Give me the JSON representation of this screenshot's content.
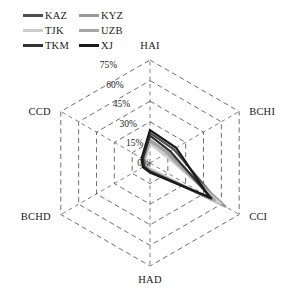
{
  "legend": {
    "items": [
      {
        "label": "KAZ",
        "color": "#4d4d4d"
      },
      {
        "label": "KYZ",
        "color": "#999999"
      },
      {
        "label": "TJK",
        "color": "#cccccc"
      },
      {
        "label": "UZB",
        "color": "#a6a6a6"
      },
      {
        "label": "TKM",
        "color": "#333333"
      },
      {
        "label": "XJ",
        "color": "#1a1a1a"
      }
    ]
  },
  "chart_data": {
    "type": "radar",
    "title": "",
    "xlabel": "",
    "ylabel": "",
    "grid": true,
    "grid_style": "dashed",
    "legend_position": "top-left",
    "categories": [
      "HAI",
      "BCHI",
      "CCI",
      "HAD",
      "BCHD",
      "CCD"
    ],
    "tick_labels": [
      "0%",
      "15%",
      "30%",
      "45%",
      "60%",
      "75%"
    ],
    "tick_values": [
      0,
      15,
      30,
      45,
      60,
      75
    ],
    "rlim": [
      0,
      75
    ],
    "tick_axis": "HAI",
    "series": [
      {
        "name": "KAZ",
        "color": "#4d4d4d",
        "values": [
          22,
          20,
          58,
          6,
          5,
          6
        ]
      },
      {
        "name": "KYZ",
        "color": "#999999",
        "values": [
          17,
          15,
          64,
          5,
          4,
          5
        ]
      },
      {
        "name": "TJK",
        "color": "#cccccc",
        "values": [
          14,
          12,
          60,
          4,
          4,
          4
        ]
      },
      {
        "name": "UZB",
        "color": "#a6a6a6",
        "values": [
          16,
          14,
          55,
          5,
          4,
          5
        ]
      },
      {
        "name": "TKM",
        "color": "#333333",
        "values": [
          20,
          17,
          52,
          6,
          5,
          6
        ]
      },
      {
        "name": "XJ",
        "color": "#1a1a1a",
        "values": [
          24,
          22,
          50,
          7,
          6,
          7
        ]
      }
    ]
  },
  "axis_label_text": {
    "hai": "HAI",
    "bchi": "BCHI",
    "cci": "CCI",
    "had": "HAD",
    "bchd": "BCHD",
    "ccd": "CCD"
  }
}
